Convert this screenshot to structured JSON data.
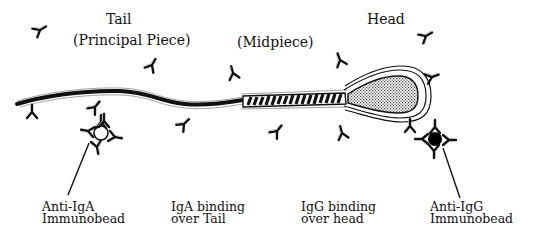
{
  "diagram": {
    "type": "biological-schematic",
    "region_labels": {
      "tail_line1": "Tail",
      "tail_line2": "(Principal Piece)",
      "midpiece": "(Midpiece)",
      "head": "Head"
    },
    "callouts": {
      "anti_iga_line1": "Anti-IgA",
      "anti_iga_line2": "Immunobead",
      "iga_binding_line1": "IgA binding",
      "iga_binding_line2": "over Tail",
      "igg_binding_line1": "IgG binding",
      "igg_binding_line2": "over head",
      "anti_igg_line1": "Anti-IgG",
      "anti_igg_line2": "Immunobead"
    },
    "components": [
      {
        "name": "principal-piece",
        "style": "solid black tapered line"
      },
      {
        "name": "midpiece",
        "style": "striped segment"
      },
      {
        "name": "head",
        "style": "stippled oval with double outline"
      },
      {
        "name": "anti-iga-immunobead",
        "style": "hollow circle with antibodies",
        "fill": "#ffffff"
      },
      {
        "name": "anti-igg-immunobead",
        "style": "solid circle with antibodies",
        "fill": "#000000"
      },
      {
        "name": "free-antibodies",
        "style": "Y-shaped glyphs"
      }
    ],
    "colors": {
      "ink": "#111111",
      "background": "#ffffff",
      "stipple": "#9a9a9a"
    }
  }
}
